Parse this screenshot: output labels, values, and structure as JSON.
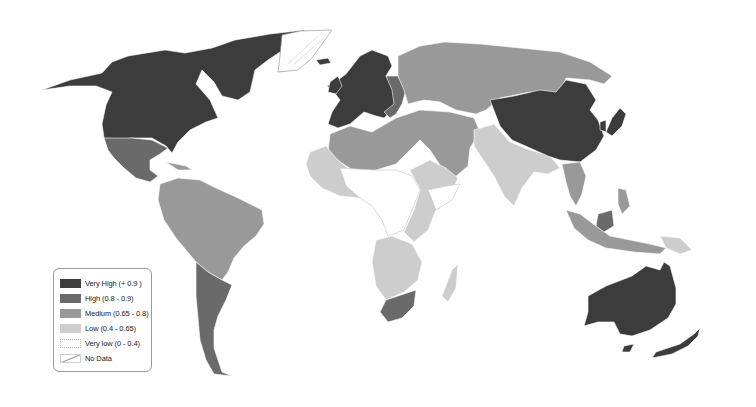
{
  "map": {
    "type": "choropleth-world-map",
    "colors": {
      "very_high": "#3c3c3c",
      "high": "#6a6a6a",
      "medium": "#999999",
      "low": "#cdcdcd",
      "very_low": "#ffffff",
      "no_data": "#ffffff",
      "border": "#ffffff"
    },
    "regions": [
      {
        "name": "North America (Canada, USA)",
        "class": "very_high"
      },
      {
        "name": "Mexico & Central America",
        "class": "high"
      },
      {
        "name": "South America (north)",
        "class": "medium"
      },
      {
        "name": "Southern Cone (Argentina, Chile)",
        "class": "high"
      },
      {
        "name": "Greenland",
        "class": "no_data"
      },
      {
        "name": "Western Europe & Scandinavia",
        "class": "very_high"
      },
      {
        "name": "Russia & Central Asia",
        "class": "medium"
      },
      {
        "name": "Middle East & North Africa",
        "class": "medium"
      },
      {
        "name": "China & Japan",
        "class": "very_high"
      },
      {
        "name": "South Asia (India)",
        "class": "low"
      },
      {
        "name": "Southeast Asia",
        "class": "medium"
      },
      {
        "name": "Sub-Saharan Africa",
        "class": "low"
      },
      {
        "name": "Central Africa",
        "class": "very_low"
      },
      {
        "name": "South Africa",
        "class": "high"
      },
      {
        "name": "Australia & New Zealand",
        "class": "very_high"
      }
    ]
  },
  "legend": {
    "items": [
      {
        "key": "very_high",
        "label": "Very High (+ 0.9 )"
      },
      {
        "key": "high",
        "label": "High (0.8 - 0.9)"
      },
      {
        "key": "medium",
        "label": "Medium (0.65 - 0.8)"
      },
      {
        "key": "low",
        "label": "Low (0.4 - 0.65)"
      },
      {
        "key": "very_low",
        "label": "Very low (0 - 0.4)"
      },
      {
        "key": "no_data",
        "label": "No Data"
      }
    ]
  }
}
